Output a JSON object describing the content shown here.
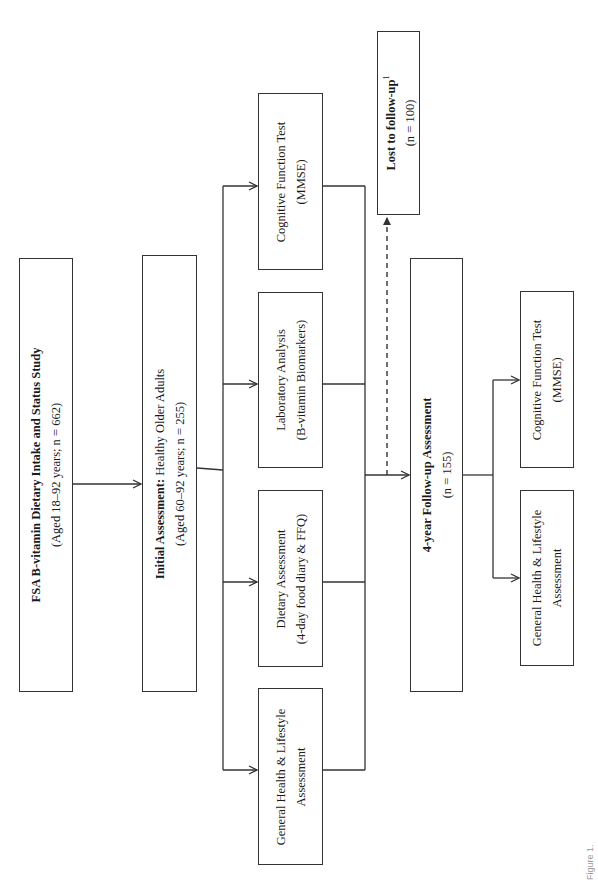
{
  "diagram": {
    "orientation": "rotated-90-ccw",
    "nodes": {
      "fsa_study": {
        "title_bold": "FSA B-vitamin Dietary Intake and Status Study",
        "subtitle": "(Aged 18–92 years; n = 662)"
      },
      "initial_assessment": {
        "title_bold": "Initial Assessment:",
        "title_rest": " Healthy Older Adults",
        "subtitle": "(Aged 60–92 years; n = 255)"
      },
      "baseline_measures": [
        {
          "line1": "Cognitive Function Test",
          "line2": "(MMSE)"
        },
        {
          "line1": "Laboratory Analysis",
          "line2": "(B-vitamin Biomarkers)"
        },
        {
          "line1": "Dietary Assessment",
          "line2": "(4-day food diary & FFQ)"
        },
        {
          "line1": "General Health & Lifestyle",
          "line2": "Assessment"
        }
      ],
      "lost_to_follow_up": {
        "title_bold": "Lost to follow-up",
        "superscript": "1",
        "subtitle": "(n = 100)"
      },
      "follow_up": {
        "title_bold": "4-year Follow-up Assessment",
        "subtitle": "(n = 155)"
      },
      "follow_up_measures": [
        {
          "line1": "Cognitive Function Test",
          "line2": "(MMSE)"
        },
        {
          "line1": "General Health & Lifestyle",
          "line2": "Assessment"
        }
      ]
    },
    "caption": "Figure 1."
  },
  "colors": {
    "stroke": "#333333",
    "text": "#1a1a1a",
    "background": "#ffffff"
  }
}
